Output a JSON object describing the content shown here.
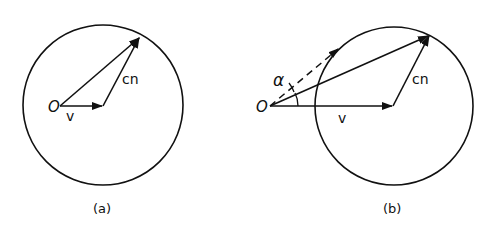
{
  "diagram": {
    "stroke_color": "#111111",
    "background": "#ffffff",
    "panels": [
      {
        "id": "a",
        "caption": "(a)",
        "origin_label": "O",
        "v_label": "v",
        "cn_label": "cn"
      },
      {
        "id": "b",
        "caption": "(b)",
        "origin_label": "O",
        "v_label": "v",
        "cn_label": "cn",
        "angle_label": "α"
      }
    ]
  }
}
